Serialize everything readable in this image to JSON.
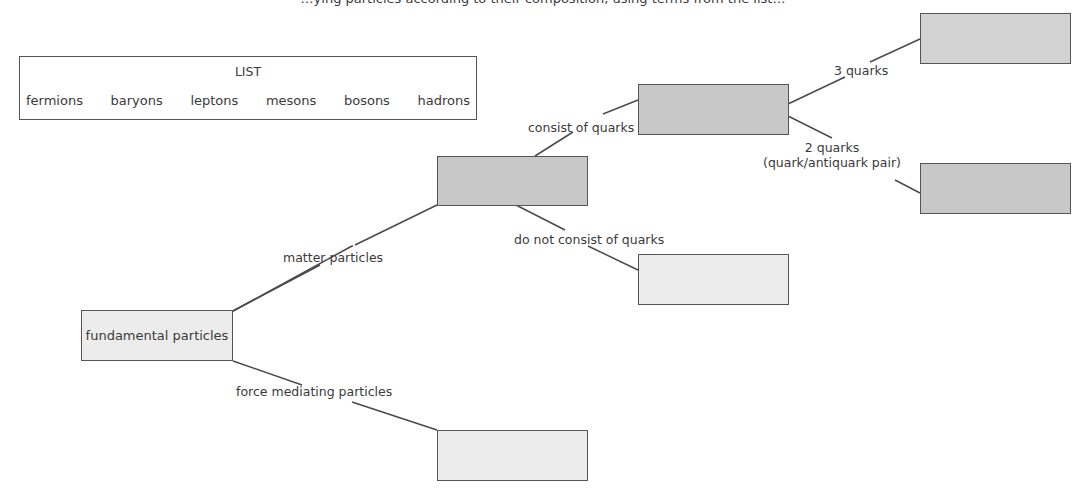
{
  "diagram": {
    "top_cut_text": "…ying particles according to their composition, using terms from the list…",
    "list": {
      "title": "LIST",
      "items": [
        "fermions",
        "baryons",
        "leptons",
        "mesons",
        "bosons",
        "hadrons"
      ]
    },
    "nodes": {
      "root": {
        "label": "fundamental particles",
        "shade": "light"
      },
      "matter": {
        "label": "",
        "shade": "dark"
      },
      "force": {
        "label": "",
        "shade": "light"
      },
      "quarks": {
        "label": "",
        "shade": "dark"
      },
      "no_quarks": {
        "label": "",
        "shade": "light"
      },
      "three_quarks": {
        "label": "",
        "shade": "light-dark"
      },
      "two_quarks": {
        "label": "",
        "shade": "dark"
      }
    },
    "edges": {
      "matter_particles": "matter particles",
      "force_mediating": "force mediating particles",
      "consist_of_quarks": "consist of quarks",
      "not_consist_of_quarks": "do not consist of quarks",
      "three_quarks": "3 quarks",
      "two_quarks_line1": "2 quarks",
      "two_quarks_line2": "(quark/antiquark pair)"
    },
    "colors": {
      "dark_fill": "#c8c8c8",
      "light_fill": "#ececec",
      "stroke": "#555555",
      "text": "#3a3a3a"
    }
  }
}
